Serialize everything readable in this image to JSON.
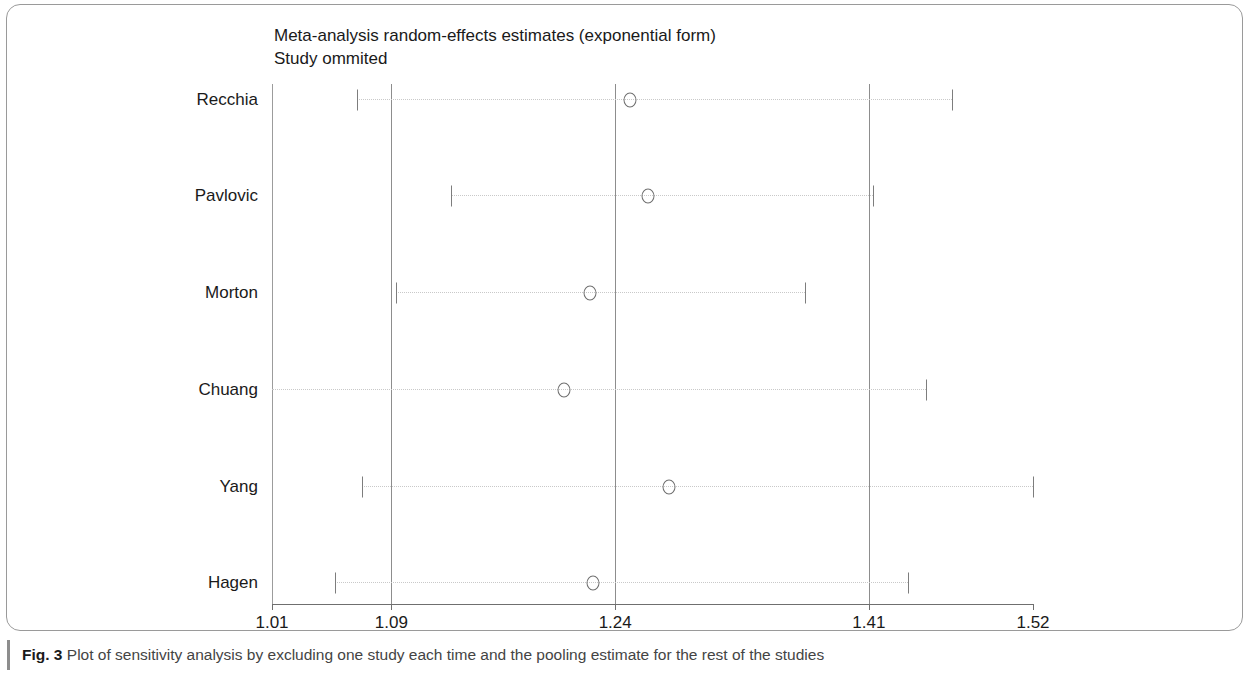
{
  "figure": {
    "caption_label": "Fig. 3",
    "caption_text": " Plot of sensitivity analysis by excluding one study each time and the pooling estimate for the rest of the studies"
  },
  "chart_data": {
    "type": "scatter",
    "title": "Meta-analysis random-effects estimates (exponential form)",
    "subtitle": "Study ommited",
    "xlabel": "",
    "ylabel": "",
    "xlim": [
      1.01,
      1.52
    ],
    "xticks": [
      1.01,
      1.09,
      1.24,
      1.41,
      1.52
    ],
    "xtick_labels": [
      "1.01",
      "1.09",
      "1.24",
      "1.41",
      "1.52"
    ],
    "reference_lines": [
      1.09,
      1.24,
      1.41
    ],
    "grid": false,
    "legend": "none",
    "categories": [
      "Recchia",
      "Pavlovic",
      "Morton",
      "Chuang",
      "Yang",
      "Hagen"
    ],
    "values": [
      1.25,
      1.262,
      1.223,
      1.206,
      1.276,
      1.225
    ],
    "ci_lower": [
      1.067,
      1.13,
      1.093,
      1.01,
      1.07,
      1.052
    ],
    "ci_upper": [
      1.466,
      1.413,
      1.367,
      1.448,
      1.522,
      1.436
    ],
    "points": [
      {
        "label": "Recchia",
        "estimate": 1.25,
        "ci_low": 1.067,
        "ci_high": 1.466
      },
      {
        "label": "Pavlovic",
        "estimate": 1.262,
        "ci_low": 1.13,
        "ci_high": 1.413
      },
      {
        "label": "Morton",
        "estimate": 1.223,
        "ci_low": 1.093,
        "ci_high": 1.367
      },
      {
        "label": "Chuang",
        "estimate": 1.206,
        "ci_low": 1.01,
        "ci_high": 1.448
      },
      {
        "label": "Yang",
        "estimate": 1.276,
        "ci_low": 1.07,
        "ci_high": 1.522
      },
      {
        "label": "Hagen",
        "estimate": 1.225,
        "ci_low": 1.052,
        "ci_high": 1.436
      }
    ]
  },
  "colors": {
    "frame": "#9a9a9a",
    "axis": "#6f6f6f",
    "reference_line": "#8d8d8d",
    "ci_line": "#c9c9c9",
    "marker": "#6f6f6f",
    "text": "#1a1a1a",
    "caption_text": "#444444"
  }
}
